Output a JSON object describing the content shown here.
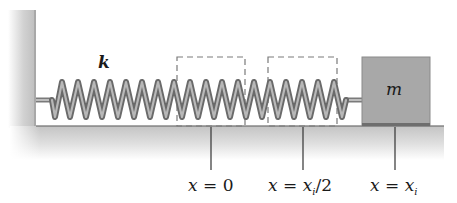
{
  "diagram": {
    "spring_constant_label": "k",
    "mass_label": "m",
    "positions": [
      {
        "var": "x",
        "eq": " = ",
        "value": "0",
        "x": 211
      },
      {
        "var": "x",
        "eq": " = ",
        "value_main": "x",
        "value_sub": "i",
        "value_suffix": "/2",
        "x": 303
      },
      {
        "var": "x",
        "eq": " = ",
        "value_main": "x",
        "value_sub": "i",
        "x": 395
      }
    ],
    "spring": {
      "coils": 20,
      "x_start": 35,
      "x_end": 360,
      "y_top": 80,
      "y_bottom": 118
    },
    "dashed_regions": [
      {
        "x": 177,
        "y": 57,
        "w": 68,
        "h": 69
      },
      {
        "x": 268,
        "y": 57,
        "w": 69,
        "h": 69
      }
    ],
    "colors": {
      "wall": "#b8b8b8",
      "floor": "#c8c8c8",
      "spring_dark": "#6a6a6a",
      "spring_light": "#b0b0b0",
      "block": "#a5a5a5",
      "dash": "#707070",
      "line": "#333333"
    }
  }
}
